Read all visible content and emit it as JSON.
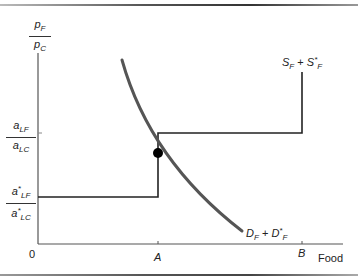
{
  "diagram": {
    "y_axis_label": {
      "numerator": "p",
      "numerator_sub": "F",
      "denominator": "p",
      "denominator_sub": "C"
    },
    "x_axis_label": "Food",
    "origin_label": "0",
    "x_ticks": [
      {
        "label": "A"
      },
      {
        "label": "B"
      }
    ],
    "y_ticks": [
      {
        "numerator": "a",
        "numerator_sub": "LF",
        "denominator": "a",
        "denominator_sub": "LC",
        "starred": false
      },
      {
        "numerator": "a",
        "numerator_sub": "LF",
        "denominator": "a",
        "denominator_sub": "LC",
        "starred": true
      }
    ],
    "supply_label": {
      "s1": "S",
      "s1_sub": "F",
      "plus": "+",
      "s2": "S",
      "s2_sup": "*",
      "s2_sub": "F"
    },
    "demand_label": {
      "d1": "D",
      "d1_sub": "F",
      "plus": "+",
      "d2": "D",
      "d2_sup": "*",
      "d2_sub": "F"
    },
    "colors": {
      "supply": "#222222",
      "demand": "#555555",
      "axes": "#555555",
      "equilibrium": "#000000"
    }
  }
}
